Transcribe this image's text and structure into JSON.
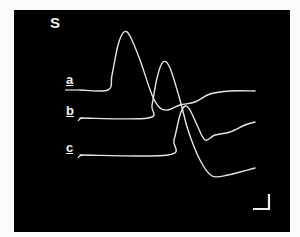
{
  "figure": {
    "panel_label": "S",
    "trace_labels": [
      "a",
      "b",
      "c"
    ],
    "background_color": "#000000",
    "trace_color": "#e8e8e8",
    "scale_bar": {
      "present": true,
      "shape": "L",
      "position": "bottom-right"
    }
  },
  "chart_data": {
    "type": "line",
    "title": "S",
    "xlabel": "",
    "ylabel": "",
    "grid": false,
    "legend": "inline labels at left of each trace",
    "series": [
      {
        "name": "a",
        "points": [
          [
            80,
            90
          ],
          [
            108,
            90
          ],
          [
            112,
            75
          ],
          [
            118,
            45
          ],
          [
            124,
            32
          ],
          [
            130,
            36
          ],
          [
            140,
            60
          ],
          [
            152,
            95
          ],
          [
            160,
            108
          ],
          [
            168,
            110
          ],
          [
            180,
            105
          ],
          [
            195,
            102
          ],
          [
            210,
            94
          ],
          [
            230,
            91
          ],
          [
            255,
            91
          ]
        ]
      },
      {
        "name": "b",
        "points": [
          [
            80,
            118
          ],
          [
            148,
            118
          ],
          [
            152,
            105
          ],
          [
            157,
            78
          ],
          [
            163,
            62
          ],
          [
            170,
            68
          ],
          [
            180,
            100
          ],
          [
            188,
            130
          ],
          [
            200,
            160
          ],
          [
            212,
            176
          ],
          [
            228,
            175
          ],
          [
            240,
            172
          ],
          [
            255,
            168
          ]
        ]
      },
      {
        "name": "c",
        "points": [
          [
            80,
            155
          ],
          [
            168,
            155
          ],
          [
            174,
            140
          ],
          [
            180,
            115
          ],
          [
            185,
            106
          ],
          [
            190,
            110
          ],
          [
            197,
            125
          ],
          [
            205,
            140
          ],
          [
            215,
            135
          ],
          [
            230,
            132
          ],
          [
            245,
            125
          ],
          [
            255,
            122
          ]
        ]
      }
    ],
    "note": "Coordinates are image pixel positions (y increases downward); axes unlabeled, scale bar without values."
  }
}
